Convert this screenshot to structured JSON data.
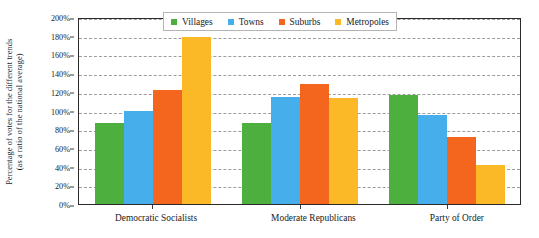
{
  "chart_data": {
    "type": "bar",
    "title": "",
    "xlabel": "",
    "ylabel": "Percentage of votes for the different trends (as a ratio of the national average)",
    "ylabel_line1": "Percentage of votes for the different trends",
    "ylabel_line2": "(as a ratio of the national average)",
    "categories": [
      "Democratic Socialists",
      "Moderate Republicans",
      "Party of Order"
    ],
    "series": [
      {
        "name": "Villages",
        "color": "#4CAF3E",
        "values": [
          87,
          87,
          117
        ]
      },
      {
        "name": "Towns",
        "color": "#46AEEA",
        "values": [
          100,
          114,
          95
        ]
      },
      {
        "name": "Suburbs",
        "color": "#F4651E",
        "values": [
          122,
          128,
          72
        ]
      },
      {
        "name": "Metropoles",
        "color": "#FBB927",
        "values": [
          179,
          113,
          42
        ]
      }
    ],
    "ylim": [
      0,
      200
    ],
    "yticks": [
      0,
      20,
      40,
      60,
      80,
      100,
      120,
      140,
      160,
      180,
      200
    ],
    "ytick_labels": [
      "0%",
      "20%",
      "40%",
      "60%",
      "80%",
      "100%",
      "120%",
      "140%",
      "160%",
      "180%",
      "200%"
    ],
    "grid": true,
    "grid_axis": "y",
    "grid_style": "dashed",
    "legend_position": "top-center",
    "legend_entries": [
      "Villages",
      "Towns",
      "Suburbs",
      "Metropoles"
    ],
    "units": "percent"
  },
  "legend": {
    "items": [
      {
        "label": "Villages",
        "color": "#4CAF3E"
      },
      {
        "label": "Towns",
        "color": "#46AEEA"
      },
      {
        "label": "Suburbs",
        "color": "#F4651E"
      },
      {
        "label": "Metropoles",
        "color": "#FBB927"
      }
    ]
  }
}
